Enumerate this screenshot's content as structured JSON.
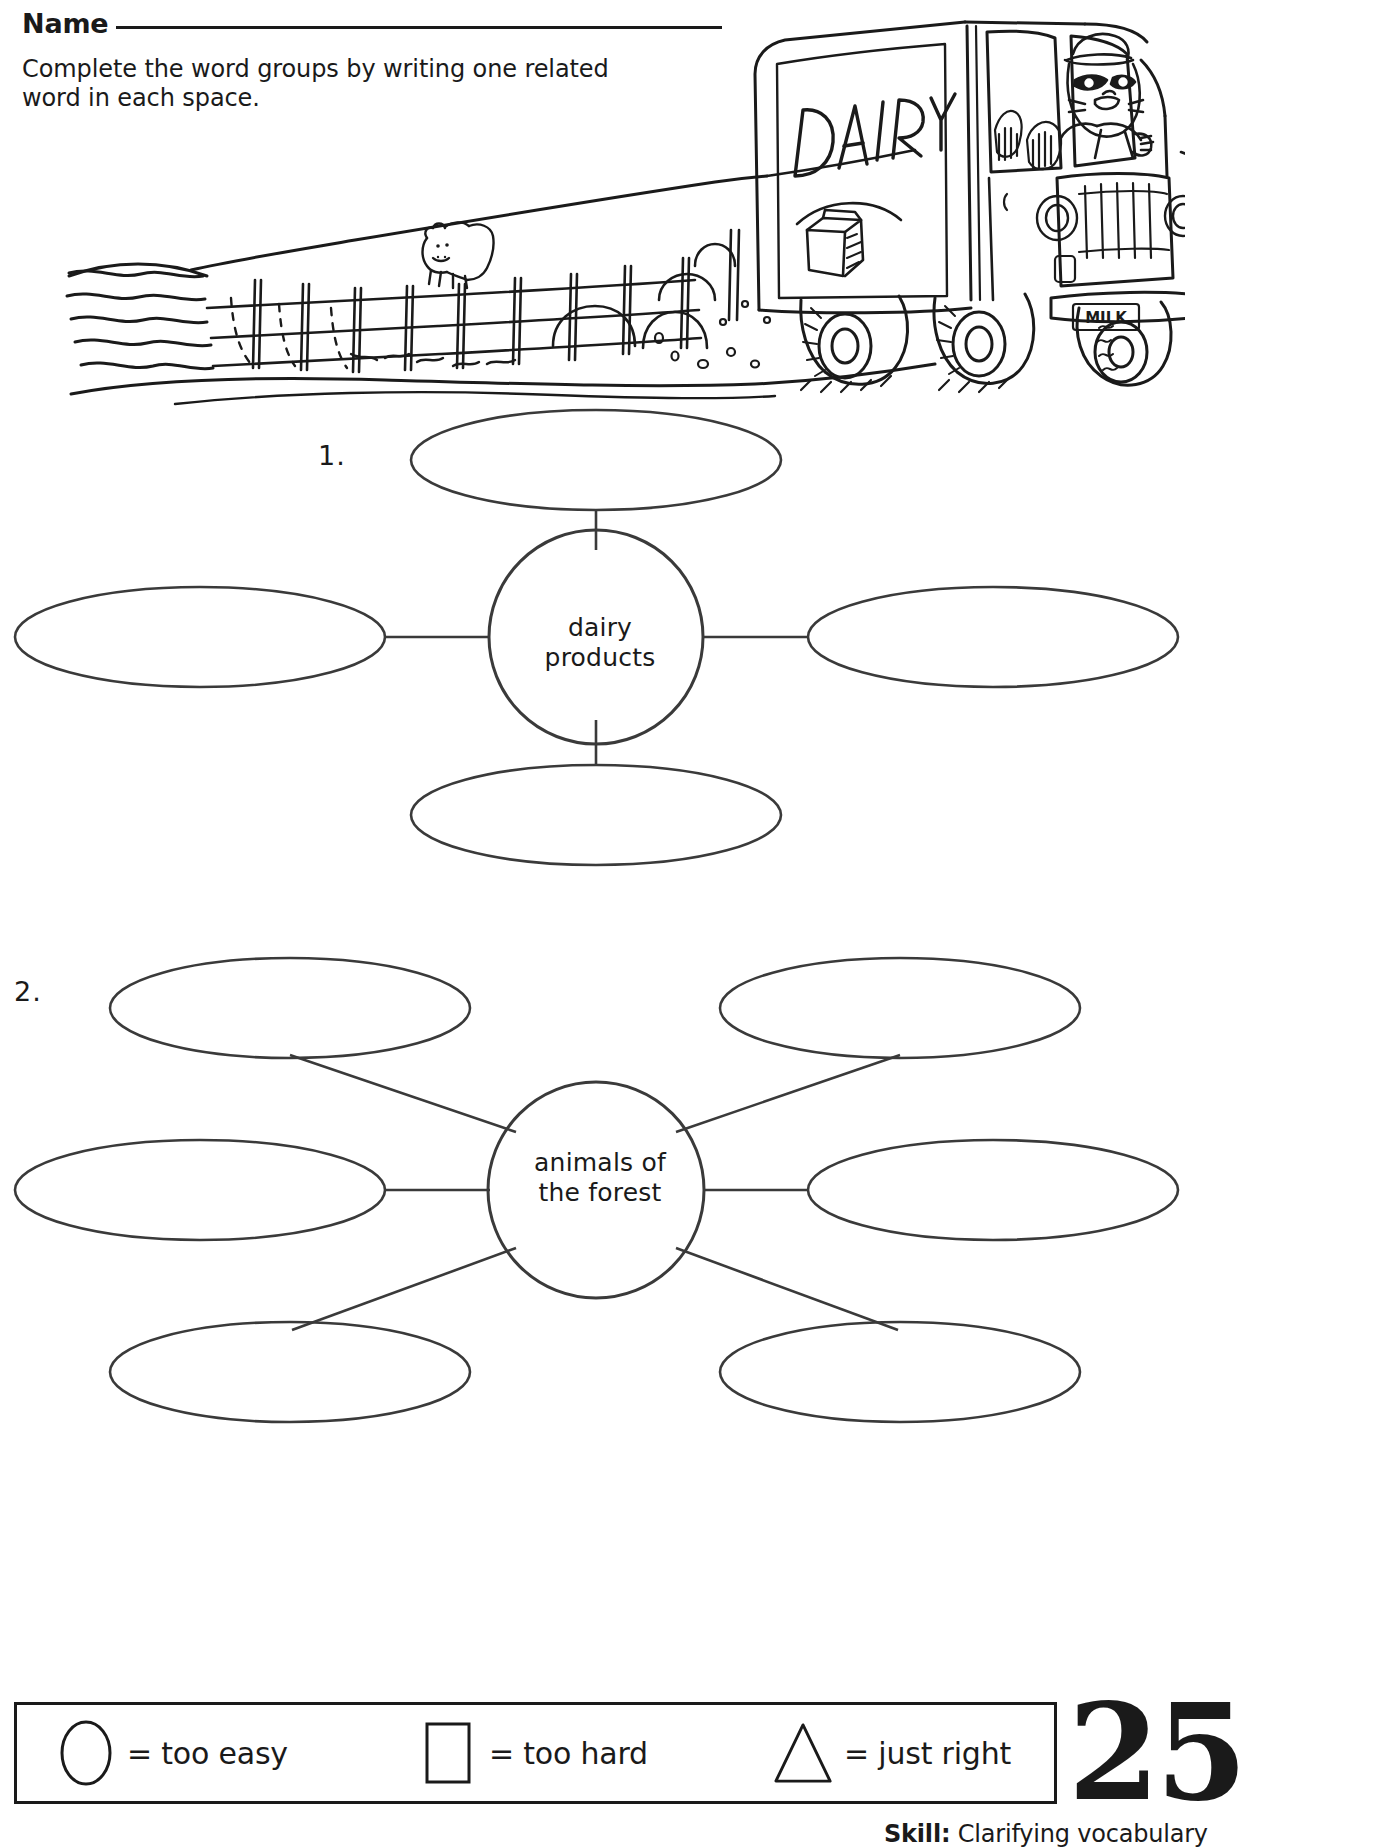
{
  "header": {
    "name_label": "Name",
    "instructions": "Complete the word groups by writing one related word in each space."
  },
  "illustration": {
    "alt_name": "dairy-truck-farm-scene",
    "truck_sign_text": "DAIRY",
    "truck_plate_text": "MILK",
    "elements": [
      "rolling-hills",
      "cow",
      "fence",
      "dairy-truck",
      "raccoon-driver",
      "milk-carton-logo",
      "road"
    ]
  },
  "webs": [
    {
      "number": "1.",
      "center_label_line1": "dairy",
      "center_label_line2": "products",
      "blank_count": 4,
      "blanks": [
        "",
        "",
        "",
        ""
      ],
      "blank_positions": [
        "top",
        "left",
        "right",
        "bottom"
      ]
    },
    {
      "number": "2.",
      "center_label_line1": "animals of",
      "center_label_line2": "the forest",
      "blank_count": 6,
      "blanks": [
        "",
        "",
        "",
        "",
        "",
        ""
      ],
      "blank_positions": [
        "top-left",
        "top-right",
        "left",
        "right",
        "bottom-left",
        "bottom-right"
      ]
    }
  ],
  "footer": {
    "legend": [
      {
        "shape": "circle",
        "text": "= too easy"
      },
      {
        "shape": "square",
        "text": "= too hard"
      },
      {
        "shape": "triangle",
        "text": "= just right"
      }
    ],
    "page_number": "25",
    "skill_prefix": "Skill:",
    "skill_text": " Clarifying vocabulary"
  },
  "colors": {
    "ink": "#1a1a1a",
    "paper": "#ffffff"
  }
}
